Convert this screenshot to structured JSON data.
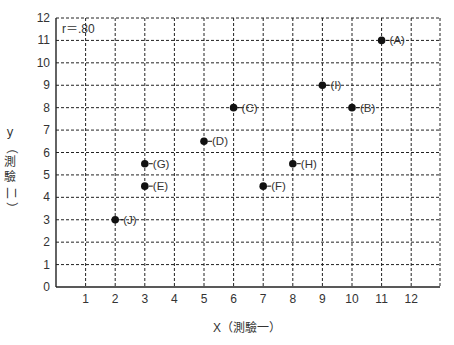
{
  "chart_data": {
    "type": "scatter",
    "title": "",
    "annotation": "r＝.80",
    "xlabel": "X（測驗一）",
    "ylabel": "y（測驗二）",
    "xlim": [
      0,
      13
    ],
    "ylim": [
      0,
      12
    ],
    "x_ticks": [
      1,
      2,
      3,
      4,
      5,
      6,
      7,
      8,
      9,
      10,
      11,
      12
    ],
    "y_ticks": [
      0,
      1,
      2,
      3,
      4,
      5,
      6,
      7,
      8,
      9,
      10,
      11,
      12
    ],
    "grid": true,
    "grid_style": "dashed",
    "points": [
      {
        "label": "(A)",
        "x": 11,
        "y": 11
      },
      {
        "label": "(B)",
        "x": 10,
        "y": 8
      },
      {
        "label": "(C)",
        "x": 6,
        "y": 8
      },
      {
        "label": "(D)",
        "x": 5,
        "y": 6.5
      },
      {
        "label": "(E)",
        "x": 3,
        "y": 4.5
      },
      {
        "label": "(F)",
        "x": 7,
        "y": 4.5
      },
      {
        "label": "(G)",
        "x": 3,
        "y": 5.5
      },
      {
        "label": "(H)",
        "x": 8,
        "y": 5.5
      },
      {
        "label": "(I)",
        "x": 9,
        "y": 9
      },
      {
        "label": "(J)",
        "x": 2,
        "y": 3
      }
    ]
  },
  "colors": {
    "point": "#111111",
    "grid": "#222222",
    "axis": "#222222",
    "text": "#333333"
  },
  "labels": {
    "x_axis_title": "X（測驗一）",
    "y_axis_letter": "y",
    "y_axis_chars": [
      "（",
      "測",
      "驗",
      "二",
      "）"
    ],
    "annotation": "r＝.80"
  }
}
